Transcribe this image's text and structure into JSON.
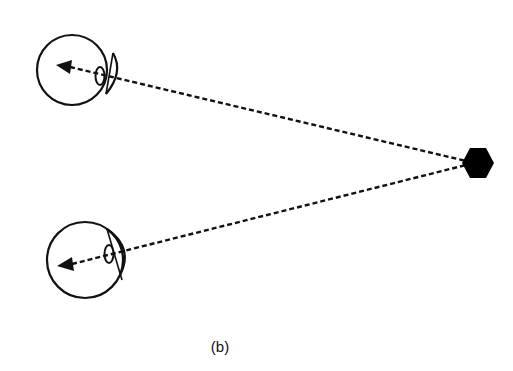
{
  "figure": {
    "caption": "(b)",
    "elements": {
      "top_eye": {
        "label": "eye-top"
      },
      "bottom_eye": {
        "label": "eye-bottom"
      },
      "object": {
        "shape": "hexagon",
        "color": "#000000"
      }
    },
    "line_style": "dashed",
    "stroke_color": "#111111"
  }
}
